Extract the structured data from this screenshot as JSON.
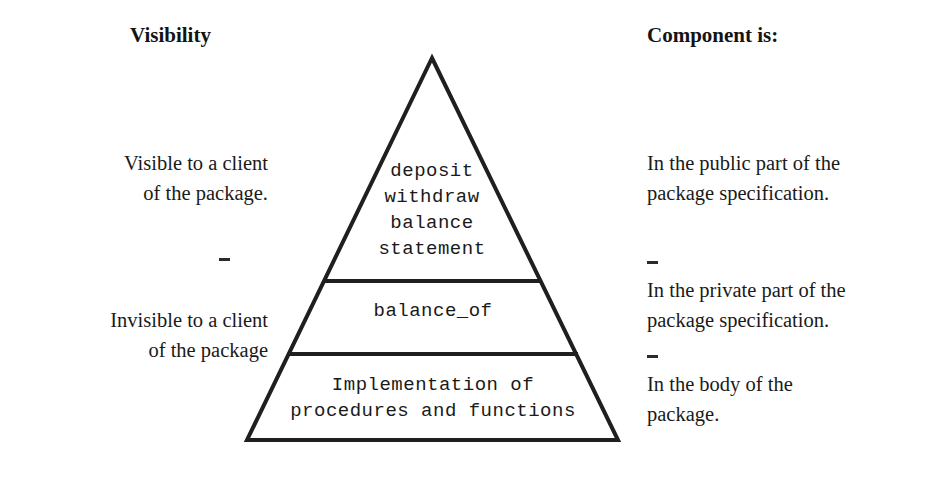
{
  "headers": {
    "left": "Visibility",
    "right": "Component is:"
  },
  "notes": {
    "visible_client": {
      "line1": "Visible to a client",
      "line2": "of the package."
    },
    "invisible_client": {
      "line1": "Invisible to a client",
      "line2": "of the package"
    },
    "public_spec": {
      "line1": "In the public part of the",
      "line2": "package specification."
    },
    "private_spec": {
      "line1": "In the private part of the",
      "line2": "package specification."
    },
    "body_package": {
      "line1": "In the body of the",
      "line2": "package."
    }
  },
  "artifacts": {
    "dash": "-"
  },
  "pyramid": {
    "stroke_color": "#1f1f1f",
    "fill_color": "#ffffff",
    "tiers": [
      {
        "name": "public-part",
        "lines": [
          "deposit",
          "withdraw",
          "balance",
          "statement"
        ]
      },
      {
        "name": "private-part",
        "lines": [
          "balance_of"
        ]
      },
      {
        "name": "package-body",
        "lines": [
          "Implementation of",
          "procedures and functions"
        ]
      }
    ]
  }
}
